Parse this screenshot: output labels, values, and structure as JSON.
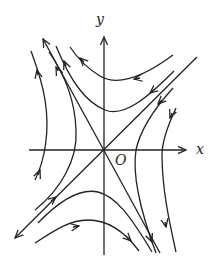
{
  "diagram": {
    "type": "phase-portrait-saddle",
    "axes": {
      "x_label": "x",
      "y_label": "y",
      "origin_label": "O"
    },
    "colors": {
      "stroke": "#222222",
      "background": "#ffffff"
    },
    "separatrices": [
      {
        "name": "diagonal",
        "direction": "outward from origin toward lower-left"
      },
      {
        "name": "anti-diagonal",
        "direction": "outward from origin toward upper-left"
      }
    ],
    "trajectory_count": 10
  }
}
